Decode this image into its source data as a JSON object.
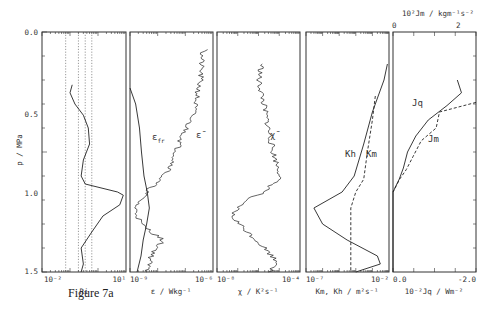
{
  "figure": {
    "caption": "Figure 7a",
    "y_axis": {
      "label": "p / MPa",
      "ticks": [
        "0.0",
        "0.5",
        "1.0",
        "1.5"
      ],
      "range": [
        0.0,
        1.5
      ],
      "inverted": true
    }
  },
  "chart_data": [
    {
      "type": "line",
      "panel": 1,
      "xlabel": "Ri",
      "x_scale": "log",
      "x_ticks": [
        "10^-2",
        "10^1"
      ],
      "xlim": [
        0.01,
        10
      ],
      "reference_lines_dotted": [
        0.07,
        0.2,
        0.35,
        0.6
      ],
      "series": [
        {
          "name": "Ri",
          "style": "solid",
          "p": [
            0.33,
            0.38,
            0.45,
            0.52,
            0.6,
            0.7,
            0.8,
            0.9,
            0.95,
            1.0,
            1.02,
            1.08,
            1.15,
            1.25,
            1.35,
            1.45,
            1.5
          ],
          "value": [
            0.12,
            0.1,
            0.15,
            0.3,
            0.45,
            0.5,
            0.3,
            0.25,
            0.35,
            5,
            8,
            6,
            1.5,
            0.6,
            0.25,
            0.3,
            0.25
          ]
        }
      ]
    },
    {
      "type": "line",
      "panel": 2,
      "xlabel": "ε / Wkg^-1",
      "x_scale": "log",
      "x_ticks": [
        "10^-9",
        "10^-6"
      ],
      "xlim": [
        1e-09,
        1e-06
      ],
      "series": [
        {
          "name": "ε_fr",
          "style": "solid",
          "p": [
            0.35,
            0.45,
            0.6,
            0.75,
            0.9,
            1.0,
            1.1,
            1.2,
            1.3,
            1.4,
            1.5
          ],
          "value": [
            1e-09,
            1.6e-09,
            2.2e-09,
            2.6e-09,
            3.2e-09,
            4.2e-09,
            5e-09,
            4e-09,
            3e-09,
            2.5e-09,
            1.8e-09
          ]
        },
        {
          "name": "ε̄",
          "style": "solid-noisy",
          "p": [
            0.11,
            0.13,
            0.3,
            0.5,
            0.7,
            0.85,
            1.0,
            1.1,
            1.2,
            1.3,
            1.4,
            1.5
          ],
          "value": [
            8e-07,
            4e-07,
            3.5e-07,
            2e-07,
            6e-08,
            3e-08,
            4e-09,
            1.5e-09,
            2.5e-09,
            1.5e-08,
            6e-09,
            4e-09
          ]
        }
      ]
    },
    {
      "type": "line",
      "panel": 3,
      "xlabel": "χ / K^2s^-1",
      "x_scale": "log",
      "x_ticks": [
        "10^-8",
        "10^-4"
      ],
      "xlim": [
        1e-08,
        0.0001
      ],
      "series": [
        {
          "name": "χ̄",
          "style": "solid-noisy",
          "p": [
            0.2,
            0.3,
            0.45,
            0.6,
            0.75,
            0.9,
            1.0,
            1.05,
            1.15,
            1.25,
            1.35,
            1.45,
            1.5
          ],
          "value": [
            1.5e-06,
            1e-06,
            1.8e-06,
            3e-06,
            5e-06,
            1.2e-05,
            2e-06,
            2e-07,
            5e-08,
            3e-07,
            2e-06,
            1e-05,
            3e-06
          ]
        }
      ]
    },
    {
      "type": "line",
      "panel": 4,
      "xlabel": "Km, Kh / m^2s^-1",
      "x_scale": "log",
      "x_ticks": [
        "10^-7",
        "10^-2"
      ],
      "xlim": [
        1e-07,
        0.01
      ],
      "series": [
        {
          "name": "K_h",
          "style": "solid",
          "p": [
            0.2,
            0.3,
            0.5,
            0.7,
            0.9,
            1.0,
            1.1,
            1.2,
            1.3,
            1.4,
            1.45,
            1.5
          ],
          "value": [
            0.008,
            0.005,
            0.001,
            0.0003,
            8e-05,
            1.5e-05,
            3e-07,
            1e-06,
            3e-05,
            0.002,
            0.003,
            0.0001
          ]
        },
        {
          "name": "K_m",
          "style": "dashed",
          "p": [
            0.4,
            0.55,
            0.75,
            0.92,
            1.0,
            1.1,
            1.2,
            1.35,
            1.5
          ],
          "value": [
            0.0015,
            0.001,
            0.0005,
            0.0003,
            0.0001,
            5e-05,
            5e-05,
            5e-05,
            5e-05
          ]
        }
      ]
    },
    {
      "type": "line",
      "panel": 5,
      "xlabel": "10^-2 Jq / Wm^-2",
      "xlabel_top": "10^2 Jm / kgm^-1s^-2",
      "x_ticks_bottom": [
        "0.0",
        "-2.0"
      ],
      "x_ticks_top": [
        "0",
        "2"
      ],
      "xlim_bottom": [
        0.0,
        -2.0
      ],
      "xlim_top": [
        0,
        2.5
      ],
      "series": [
        {
          "name": "J_q",
          "style": "solid",
          "p": [
            0.3,
            0.38,
            0.46,
            0.55,
            0.65,
            0.75,
            0.85,
            0.92,
            1.0,
            1.5
          ],
          "value": [
            -1.55,
            -1.65,
            -1.3,
            -0.85,
            -0.55,
            -0.35,
            -0.25,
            -0.15,
            0.0,
            0.0
          ]
        },
        {
          "name": "J_m",
          "style": "dashed",
          "p": [
            0.44,
            0.5,
            0.6,
            0.68,
            0.78,
            0.86,
            0.92,
            1.0
          ],
          "value": [
            2.5,
            1.4,
            1.3,
            0.85,
            0.6,
            0.4,
            0.2,
            0.0
          ]
        }
      ]
    }
  ],
  "panels": [
    {
      "xlabel": "Ri",
      "tick_left": "10⁻²",
      "tick_right": "10¹"
    },
    {
      "xlabel": "ε / Wkg⁻¹",
      "tick_left": "10⁻⁹",
      "tick_right": "10⁻⁶",
      "curve_labels": [
        "ε",
        "ε̄"
      ],
      "curve_label_sub": "fr"
    },
    {
      "xlabel": "χ / K²s⁻¹",
      "tick_left": "10⁻⁸",
      "tick_right": "10⁻⁴",
      "curve_labels": [
        "χ̄"
      ]
    },
    {
      "xlabel": "Km, Kh / m²s⁻¹",
      "tick_left": "10⁻⁷",
      "tick_right": "10⁻²",
      "curve_labels": [
        "Kh",
        "Km"
      ]
    },
    {
      "xlabel": "10⁻²Jq / Wm⁻²",
      "tick_left": "0.0",
      "tick_right": "-2.0",
      "top_label": "10²Jm / kgm⁻¹s⁻²",
      "top_tick_left": "0",
      "top_tick_right": "2",
      "curve_labels": [
        "Jq",
        "Jm"
      ]
    }
  ]
}
